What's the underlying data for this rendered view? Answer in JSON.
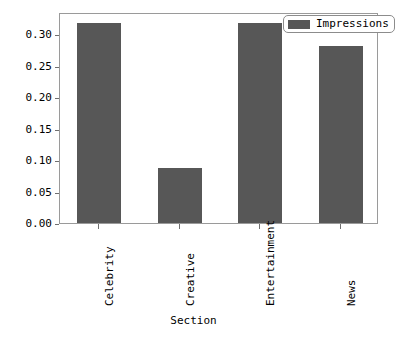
{
  "chart_data": {
    "type": "bar",
    "title": "",
    "xlabel": "Section",
    "ylabel": "Fraction of Impressions",
    "categories": [
      "Celebrity",
      "Creative",
      "Entertainment",
      "News"
    ],
    "values": [
      0.317,
      0.088,
      0.317,
      0.281
    ],
    "series": [
      {
        "name": "Impressions",
        "values": [
          0.317,
          0.088,
          0.317,
          0.281
        ]
      }
    ],
    "ylim": [
      0.0,
      0.335
    ],
    "yticks": [
      "0.00",
      "0.05",
      "0.10",
      "0.15",
      "0.20",
      "0.25",
      "0.30"
    ],
    "ytick_values": [
      0.0,
      0.05,
      0.1,
      0.15,
      0.2,
      0.25,
      0.3
    ],
    "grid": false,
    "legend": {
      "position": "upper right",
      "entries": [
        "Impressions"
      ]
    },
    "colors": {
      "bar": "#575757",
      "background": "#ffffff",
      "frame": "#9a9a9a",
      "text": "#000000"
    }
  }
}
